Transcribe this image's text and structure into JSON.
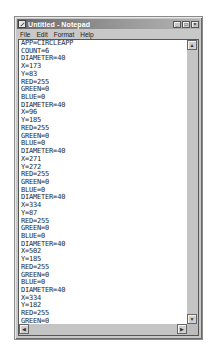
{
  "window": {
    "title": "Untitled - Notepad",
    "controls": {
      "minimize": "_",
      "maximize": "□",
      "close": "×"
    }
  },
  "menu": {
    "items": [
      "File",
      "Edit",
      "Format",
      "Help"
    ]
  },
  "editor": {
    "lines": [
      "APP=CIRCLEAPP",
      "COUNT=6",
      "DIAMETER=40",
      "X=173",
      "Y=83",
      "RED=255",
      "GREEN=0",
      "BLUE=0",
      "DIAMETER=40",
      "X=96",
      "Y=185",
      "RED=255",
      "GREEN=0",
      "BLUE=0",
      "DIAMETER=40",
      "X=271",
      "Y=272",
      "RED=255",
      "GREEN=0",
      "BLUE=0",
      "DIAMETER=40",
      "X=334",
      "Y=87",
      "RED=255",
      "GREEN=0",
      "BLUE=0",
      "DIAMETER=40",
      "X=502",
      "Y=185",
      "RED=255",
      "GREEN=0",
      "BLUE=0",
      "DIAMETER=40",
      "X=334",
      "Y=182",
      "RED=255",
      "GREEN=0",
      "BLUE=0"
    ]
  },
  "scrollbars": {
    "up_arrow": "▲",
    "down_arrow": "▼",
    "left_arrow": "◀",
    "right_arrow": "▶"
  }
}
